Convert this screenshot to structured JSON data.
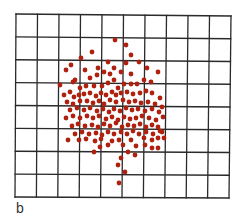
{
  "panel_label": "b",
  "colors": {
    "grid": "#2a2a2a",
    "dot": "#b0200f",
    "background": "#ffffff"
  },
  "grid": {
    "columns": 10,
    "rows": 8,
    "corners": {
      "tl": [
        16,
        14
      ],
      "tr": [
        231,
        16
      ],
      "bl": [
        15,
        197
      ],
      "br": [
        229,
        198
      ]
    }
  },
  "chart_data": {
    "type": "scatter",
    "title": "",
    "xlabel": "",
    "ylabel": "",
    "grid": true,
    "grid_size": [
      10,
      8
    ],
    "annotation": "b",
    "dot_radius": 2.4,
    "points_px": [
      [
        115,
        40
      ],
      [
        92,
        52
      ],
      [
        81,
        58
      ],
      [
        126,
        45
      ],
      [
        131,
        55
      ],
      [
        71,
        65
      ],
      [
        108,
        62
      ],
      [
        98,
        68
      ],
      [
        66,
        70
      ],
      [
        85,
        70
      ],
      [
        75,
        80
      ],
      [
        104,
        72
      ],
      [
        114,
        68
      ],
      [
        126,
        63
      ],
      [
        139,
        62
      ],
      [
        147,
        68
      ],
      [
        60,
        85
      ],
      [
        73,
        82
      ],
      [
        90,
        78
      ],
      [
        97,
        75
      ],
      [
        110,
        74
      ],
      [
        121,
        72
      ],
      [
        131,
        74
      ],
      [
        158,
        72
      ],
      [
        64,
        95
      ],
      [
        70,
        92
      ],
      [
        80,
        88
      ],
      [
        86,
        86
      ],
      [
        94,
        86
      ],
      [
        102,
        86
      ],
      [
        108,
        83
      ],
      [
        114,
        80
      ],
      [
        118,
        88
      ],
      [
        124,
        84
      ],
      [
        131,
        84
      ],
      [
        137,
        84
      ],
      [
        144,
        80
      ],
      [
        151,
        82
      ],
      [
        74,
        97
      ],
      [
        79,
        95
      ],
      [
        84,
        94
      ],
      [
        90,
        93
      ],
      [
        96,
        96
      ],
      [
        101,
        93
      ],
      [
        106,
        95
      ],
      [
        112,
        92
      ],
      [
        116,
        95
      ],
      [
        121,
        93
      ],
      [
        127,
        92
      ],
      [
        133,
        94
      ],
      [
        140,
        93
      ],
      [
        146,
        91
      ],
      [
        152,
        93
      ],
      [
        160,
        98
      ],
      [
        67,
        102
      ],
      [
        73,
        104
      ],
      [
        80,
        101
      ],
      [
        87,
        101
      ],
      [
        93,
        103
      ],
      [
        99,
        101
      ],
      [
        104,
        104
      ],
      [
        110,
        100
      ],
      [
        116,
        102
      ],
      [
        123,
        100
      ],
      [
        129,
        102
      ],
      [
        135,
        101
      ],
      [
        141,
        103
      ],
      [
        148,
        102
      ],
      [
        155,
        104
      ],
      [
        162,
        107
      ],
      [
        70,
        110
      ],
      [
        77,
        108
      ],
      [
        84,
        110
      ],
      [
        90,
        108
      ],
      [
        97,
        111
      ],
      [
        103,
        109
      ],
      [
        109,
        112
      ],
      [
        114,
        109
      ],
      [
        120,
        111
      ],
      [
        126,
        108
      ],
      [
        132,
        110
      ],
      [
        138,
        109
      ],
      [
        145,
        111
      ],
      [
        152,
        109
      ],
      [
        159,
        112
      ],
      [
        66,
        118
      ],
      [
        73,
        116
      ],
      [
        80,
        118
      ],
      [
        87,
        116
      ],
      [
        93,
        118
      ],
      [
        99,
        116
      ],
      [
        106,
        119
      ],
      [
        112,
        117
      ],
      [
        118,
        120
      ],
      [
        124,
        117
      ],
      [
        130,
        119
      ],
      [
        136,
        118
      ],
      [
        142,
        116
      ],
      [
        149,
        118
      ],
      [
        156,
        120
      ],
      [
        163,
        117
      ],
      [
        72,
        126
      ],
      [
        78,
        124
      ],
      [
        85,
        126
      ],
      [
        92,
        125
      ],
      [
        98,
        127
      ],
      [
        104,
        124
      ],
      [
        110,
        126
      ],
      [
        116,
        123
      ],
      [
        122,
        127
      ],
      [
        128,
        125
      ],
      [
        134,
        126
      ],
      [
        140,
        124
      ],
      [
        146,
        127
      ],
      [
        152,
        125
      ],
      [
        158,
        127
      ],
      [
        75,
        134
      ],
      [
        82,
        132
      ],
      [
        89,
        134
      ],
      [
        96,
        133
      ],
      [
        102,
        135
      ],
      [
        108,
        132
      ],
      [
        114,
        134
      ],
      [
        121,
        132
      ],
      [
        127,
        134
      ],
      [
        133,
        131
      ],
      [
        139,
        134
      ],
      [
        146,
        132
      ],
      [
        153,
        134
      ],
      [
        160,
        131
      ],
      [
        68,
        140
      ],
      [
        79,
        140
      ],
      [
        86,
        139
      ],
      [
        95,
        141
      ],
      [
        101,
        139
      ],
      [
        112,
        141
      ],
      [
        119,
        140
      ],
      [
        131,
        140
      ],
      [
        144,
        138
      ],
      [
        152,
        140
      ],
      [
        158,
        138
      ],
      [
        162,
        132
      ],
      [
        100,
        147
      ],
      [
        108,
        145
      ],
      [
        123,
        145
      ],
      [
        136,
        146
      ],
      [
        145,
        145
      ],
      [
        152,
        148
      ],
      [
        94,
        152
      ],
      [
        128,
        152
      ],
      [
        121,
        158
      ],
      [
        135,
        155
      ],
      [
        118,
        165
      ],
      [
        125,
        172
      ],
      [
        119,
        183
      ],
      [
        158,
        148
      ],
      [
        164,
        138
      ]
    ]
  }
}
